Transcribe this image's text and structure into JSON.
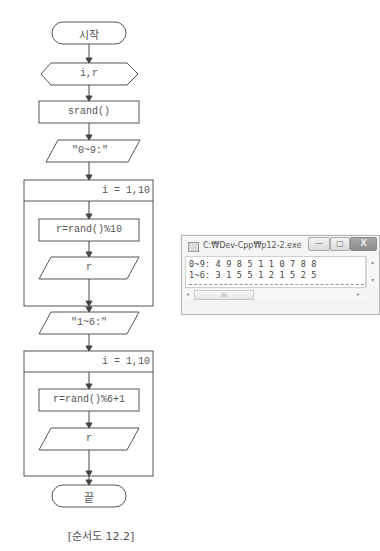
{
  "flowchart": {
    "start_label": "시작",
    "declare_label": "i,r",
    "srand_label": "srand()",
    "output1_label": "\"0~9:\"",
    "loop1_header": "i = 1,10",
    "assign1_label": "r=rand()%10",
    "print1_label": "r",
    "output2_label": "\"1~6:\"",
    "loop2_header": "i = 1,10",
    "assign2_label": "r=rand()%6+1",
    "print2_label": "r",
    "end_label": "끝",
    "caption": "[순서도 12.2]"
  },
  "console": {
    "title": "C:₩Dev-Cpp₩p12-2.exe",
    "minimize_glyph": "—",
    "maximize_glyph": "□",
    "close_glyph": "X",
    "lines": [
      "0~9: 4 9 8 5 1 1 0 7 8 8",
      "1~6: 3 1 5 5 1 2 1 5 2 5"
    ],
    "scroll_up_glyph": "▴",
    "scroll_down_glyph": "▾",
    "scroll_left_glyph": "◂",
    "scroll_right_glyph": "▸",
    "thumb_grip": "III"
  }
}
